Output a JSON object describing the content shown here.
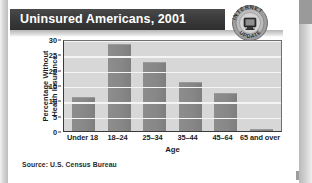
{
  "page": {
    "title": "Uninsured Americans, 2001",
    "source": "Source: U.S. Census Bureau"
  },
  "badge": {
    "name": "internet-update-seal",
    "top_text": "INTERNET",
    "bottom_text": "UPDATE"
  },
  "colors": {
    "title_bar": "#3b3b3b",
    "title_text": "#ffffff",
    "plot_background": "#d7d7d7",
    "gridline": "#f4f4f4",
    "bar": "#878787",
    "axis": "#3a3a3a",
    "page_background": "#ffffff"
  },
  "chart_data": {
    "type": "bar",
    "title": "Uninsured Americans, 2001",
    "xlabel": "Age",
    "ylabel": "Percentage Without Health Insurance",
    "ylabel_lines": [
      "Percentage Without",
      "Health Insurance"
    ],
    "categories": [
      "Under 18",
      "18–24",
      "25–34",
      "35–44",
      "45–64",
      "65 and over"
    ],
    "values": [
      11,
      28.5,
      22.5,
      16,
      12.5,
      0.8
    ],
    "ylim": [
      0,
      30
    ],
    "yticks": [
      0,
      5,
      10,
      15,
      20,
      25,
      30
    ],
    "ytick_labels": [
      "0",
      "5",
      "10",
      "15",
      "20",
      "25",
      "30"
    ],
    "grid": true,
    "legend": false,
    "source": "Source: U.S. Census Bureau"
  }
}
